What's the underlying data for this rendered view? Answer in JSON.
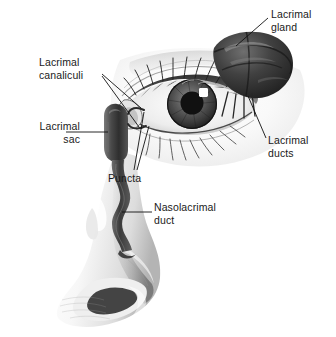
{
  "figure": {
    "style": "grayscale pencil anatomical illustration",
    "background_color": "#ffffff",
    "text_color": "#1a1a1a",
    "leader_line_color": "#111111"
  },
  "labels": {
    "lacrimal_gland": "Lacrimal\ngland",
    "lacrimal_canaliculi": "Lacrimal\ncanaliculi",
    "lacrimal_sac": "Lacrimal\nsac",
    "lacrimal_ducts": "Lacrimal\nducts",
    "puncta": "Puncta",
    "nasolacrimal_duct": "Nasolacrimal\nduct"
  },
  "structures": [
    {
      "name": "lacrimal-gland",
      "description": "dark lobed gland at upper outer eyelid"
    },
    {
      "name": "lacrimal-ducts",
      "description": "ducts descending from gland into upper conjunctival fornix"
    },
    {
      "name": "lacrimal-canaliculi",
      "description": "small channels from puncta to lacrimal sac"
    },
    {
      "name": "puncta",
      "description": "two small openings at medial eyelid margins"
    },
    {
      "name": "lacrimal-sac",
      "description": "dark vertical sac at medial canthus"
    },
    {
      "name": "nasolacrimal-duct",
      "description": "wavy duct descending into nasal cavity"
    },
    {
      "name": "eye",
      "description": "open eye with iris, pupil, highlight and eyelashes"
    },
    {
      "name": "nose",
      "description": "nose in three-quarter profile"
    }
  ]
}
